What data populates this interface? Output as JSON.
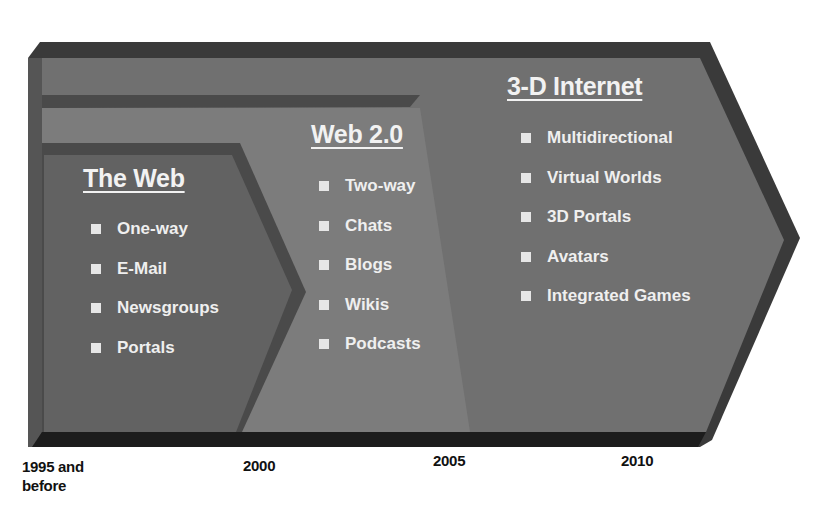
{
  "diagram": {
    "type": "timeline-arrows",
    "colors": {
      "outer_arrow": "#6f6f6f",
      "outer_shadow": "#3a3a3a",
      "inner_arrow": "#616161",
      "web2_region": "#7d7d7d",
      "bottom_band": "#1e1e1e",
      "text": "#f0f0f0"
    },
    "stages": [
      {
        "title": "The Web",
        "items": [
          "One-way",
          "E-Mail",
          "Newsgroups",
          "Portals"
        ]
      },
      {
        "title": "Web 2.0",
        "items": [
          "Two-way",
          "Chats",
          "Blogs",
          "Wikis",
          "Podcasts"
        ]
      },
      {
        "title": "3-D Internet",
        "items": [
          "Multidirectional",
          "Virtual Worlds",
          "3D Portals",
          "Avatars",
          "Integrated Games"
        ]
      }
    ],
    "timeline": [
      {
        "label_line1": "1995 and",
        "label_line2": "before"
      },
      {
        "label_line1": "2000"
      },
      {
        "label_line1": "2005"
      },
      {
        "label_line1": "2010"
      }
    ]
  }
}
